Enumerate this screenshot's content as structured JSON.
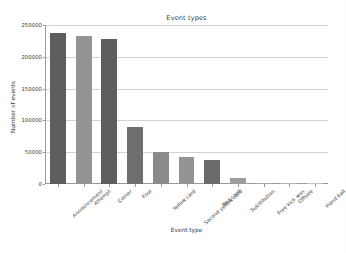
{
  "chart_data": {
    "type": "bar",
    "title": "Event types",
    "xlabel": "Event type",
    "ylabel": "Number of events",
    "categories": [
      "Announcement",
      "Attempt",
      "Corner",
      "Foul",
      "Yellow card",
      "Second yellow card",
      "Red card",
      "Substitution",
      "Free kick won",
      "Offside",
      "Hand ball"
    ],
    "values": [
      238000,
      232000,
      228000,
      90000,
      50000,
      42000,
      38000,
      9000,
      1500,
      800,
      200
    ],
    "bar_colors": [
      "#5e5e5e",
      "#949494",
      "#5e5e5e",
      "#6f6f6f",
      "#8a8a8a",
      "#949494",
      "#6a6a6a",
      "#9c9c9c",
      "#a8a8a8",
      "#b4b4b4",
      "#c4c4c4"
    ],
    "ylim": [
      0,
      250000
    ],
    "yticks": [
      0,
      50000,
      100000,
      150000,
      200000,
      250000
    ],
    "ytick_labels": [
      "0",
      "50000",
      "100000",
      "150000",
      "200000",
      "250000"
    ],
    "grid": "horizontal",
    "legend": "none",
    "axis_color": "#9a9a9a",
    "gridline_color": "#d3d3d3",
    "plot_background": "#ffffff",
    "figure_background": "#fdfdfd"
  }
}
